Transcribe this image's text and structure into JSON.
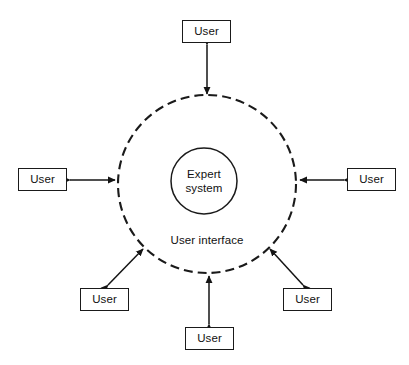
{
  "diagram": {
    "core": {
      "label_line1": "Expert",
      "label_line2": "system",
      "shape": "solid-circle",
      "stroke_color": "#1a1a1a",
      "cx": 204,
      "cy": 181,
      "r": 33
    },
    "shell": {
      "label": "User interface",
      "shape": "dashed-circle",
      "stroke_color": "#1a1a1a",
      "cx": 207,
      "cy": 184,
      "r": 89,
      "dash_pattern": "9 5"
    },
    "nodes": [
      {
        "id": "user-top",
        "label": "User",
        "x": 182,
        "y": 20,
        "w": 49,
        "h": 23
      },
      {
        "id": "user-left",
        "label": "User",
        "x": 18,
        "y": 168,
        "w": 49,
        "h": 23
      },
      {
        "id": "user-right",
        "label": "User",
        "x": 347,
        "y": 168,
        "w": 49,
        "h": 23
      },
      {
        "id": "user-bottom-left",
        "label": "User",
        "x": 80,
        "y": 288,
        "w": 49,
        "h": 23
      },
      {
        "id": "user-bottom",
        "label": "User",
        "x": 185,
        "y": 327,
        "w": 49,
        "h": 23
      },
      {
        "id": "user-bottom-right",
        "label": "User",
        "x": 283,
        "y": 288,
        "w": 49,
        "h": 23
      }
    ],
    "connectors": [
      {
        "id": "connector-top",
        "from": "user-top",
        "to": "shell",
        "style": "double-arrow",
        "x1": 207,
        "y1": 45,
        "x2": 207,
        "y2": 94
      },
      {
        "id": "connector-left",
        "from": "user-left",
        "to": "shell",
        "style": "double-arrow",
        "x1": 70,
        "y1": 180,
        "x2": 115,
        "y2": 180
      },
      {
        "id": "connector-right",
        "from": "user-right",
        "to": "shell",
        "style": "double-arrow",
        "x1": 344,
        "y1": 180,
        "x2": 300,
        "y2": 180
      },
      {
        "id": "connector-bottom-left",
        "from": "user-bottom-left",
        "to": "shell",
        "style": "double-arrow",
        "x1": 108,
        "y1": 285,
        "x2": 143,
        "y2": 249
      },
      {
        "id": "connector-bottom",
        "from": "user-bottom",
        "to": "shell",
        "style": "double-arrow",
        "x1": 209,
        "y1": 324,
        "x2": 209,
        "y2": 276
      },
      {
        "id": "connector-bottom-right",
        "from": "user-bottom-right",
        "to": "shell",
        "style": "double-arrow",
        "x1": 303,
        "y1": 285,
        "x2": 270,
        "y2": 249
      }
    ]
  }
}
